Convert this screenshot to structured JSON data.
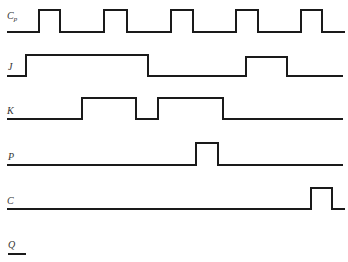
{
  "diagram": {
    "type": "timing-diagram",
    "line_color": "#1a1a1a",
    "label_color": "#333333",
    "signals": [
      {
        "name": "Cp",
        "label_main": "C",
        "label_sub": "p",
        "label_pos": [
          7,
          19
        ],
        "points": "7,32 39,32 39,10 60,10 60,32 104,32 104,10 127,10 127,32 171,32 171,10 193,10 193,32 236,32 236,10 258,10 258,32 301,32 301,10 322,10 322,32 345,32"
      },
      {
        "name": "J",
        "label_main": "J",
        "label_sub": "",
        "label_pos": [
          8,
          70
        ],
        "points": "7,76 26,76 26,55 148,55 148,76 246,76 246,57 287,57 287,76 343,76"
      },
      {
        "name": "K",
        "label_main": "K",
        "label_sub": "",
        "label_pos": [
          7,
          114
        ],
        "points": "7,119 82,119 82,98 136,98 136,119 158,119 158,98 223,98 223,119 343,119"
      },
      {
        "name": "P",
        "label_main": "P",
        "label_sub": "",
        "label_pos": [
          8,
          160
        ],
        "points": "7,165 196,165 196,143 218,143 218,165 343,165"
      },
      {
        "name": "C",
        "label_main": "C",
        "label_sub": "",
        "label_pos": [
          7,
          204
        ],
        "points": "7,209 311,209 311,188 332,188 332,209 345,209"
      },
      {
        "name": "Q",
        "label_main": "Q",
        "label_sub": "",
        "label_pos": [
          8,
          248
        ],
        "points": "8,254 26,254"
      }
    ]
  }
}
